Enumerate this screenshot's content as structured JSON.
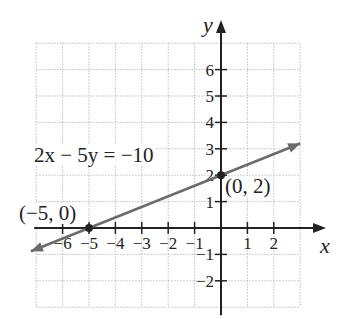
{
  "top_cropped_text": "",
  "chart_data": {
    "type": "line",
    "title": "",
    "xlabel": "x",
    "ylabel": "y",
    "xlim": [
      -7,
      3
    ],
    "ylim": [
      -3,
      7
    ],
    "grid": true,
    "grid_style": "dotted",
    "x_ticks": [
      -6,
      -5,
      -4,
      -3,
      -2,
      -1,
      1,
      2
    ],
    "x_tick_labels": [
      "−6",
      "−5",
      "−4",
      "−3",
      "−2",
      "−1",
      "1",
      "2"
    ],
    "y_ticks": [
      -2,
      -1,
      1,
      2,
      3,
      4,
      5,
      6
    ],
    "y_tick_labels": [
      "−2",
      "−1",
      "1",
      "2",
      "3",
      "4",
      "5",
      "6"
    ],
    "series": [
      {
        "name": "2x − 5y = −10",
        "equation": "2x - 5y = -10",
        "slope": 0.4,
        "intercept": 2,
        "x": [
          -7.2,
          3
        ],
        "y": [
          -0.88,
          3.2
        ],
        "arrows_both_ends": true,
        "color": "#6b6b6b"
      }
    ],
    "points": [
      {
        "x": -5,
        "y": 0,
        "label": "(−5, 0)"
      },
      {
        "x": 0,
        "y": 2,
        "label": "(0, 2)"
      }
    ],
    "annotations": [
      {
        "text": "2x − 5y = −10",
        "near": [
          -5.5,
          2.6
        ]
      }
    ]
  },
  "labels": {
    "equation": "2x − 5y = −10",
    "point_a": "(−5, 0)",
    "point_b": "(0, 2)",
    "x_axis": "x",
    "y_axis": "y"
  },
  "colors": {
    "axis": "#222222",
    "grid": "#bdbdbd",
    "line": "#6b6b6b",
    "text": "#222222"
  }
}
